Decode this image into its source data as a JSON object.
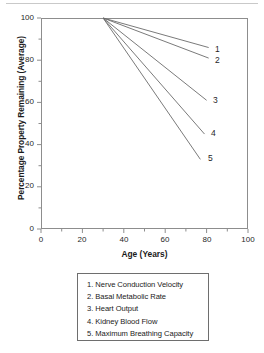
{
  "chart_data": {
    "type": "line",
    "title": "",
    "xlabel": "Age (Years)",
    "ylabel": "Percentage Property Remaining (Average)",
    "xlim": [
      0,
      100
    ],
    "ylim": [
      0,
      100
    ],
    "xticks": [
      0,
      20,
      40,
      60,
      80,
      100
    ],
    "yticks": [
      0,
      20,
      40,
      60,
      80,
      100
    ],
    "xtick_labels": [
      "0",
      "20",
      "40",
      "60",
      "80",
      "100"
    ],
    "ytick_labels": [
      "0",
      "20",
      "40",
      "60",
      "80",
      "100"
    ],
    "minor_tick_step": 10,
    "grid": false,
    "legend_position": "below-plot",
    "line_color": "#6b6b6b",
    "frame_color": "#8d8d8d",
    "series": [
      {
        "name": "Nerve Conduction Velocity",
        "key": "1",
        "end_label": "1",
        "x": [
          30,
          81
        ],
        "values": [
          100,
          86
        ]
      },
      {
        "name": "Basal Metabolic Rate",
        "key": "2",
        "end_label": "2",
        "x": [
          30,
          81
        ],
        "values": [
          100,
          81
        ]
      },
      {
        "name": "Heart Output",
        "key": "3",
        "end_label": "3",
        "x": [
          30,
          80
        ],
        "values": [
          100,
          61
        ]
      },
      {
        "name": "Kidney Blood Flow",
        "key": "4",
        "end_label": "4",
        "x": [
          30,
          79
        ],
        "values": [
          100,
          45
        ]
      },
      {
        "name": "Maximum Breathing Capacity",
        "key": "5",
        "end_label": "5",
        "x": [
          30,
          77
        ],
        "values": [
          100,
          33
        ]
      }
    ],
    "legend_entries": [
      "1. Nerve Conduction Velocity",
      "2. Basal Metabolic Rate",
      "3. Heart Output",
      "4. Kidney Blood Flow",
      "5. Maximum Breathing Capacity"
    ]
  }
}
